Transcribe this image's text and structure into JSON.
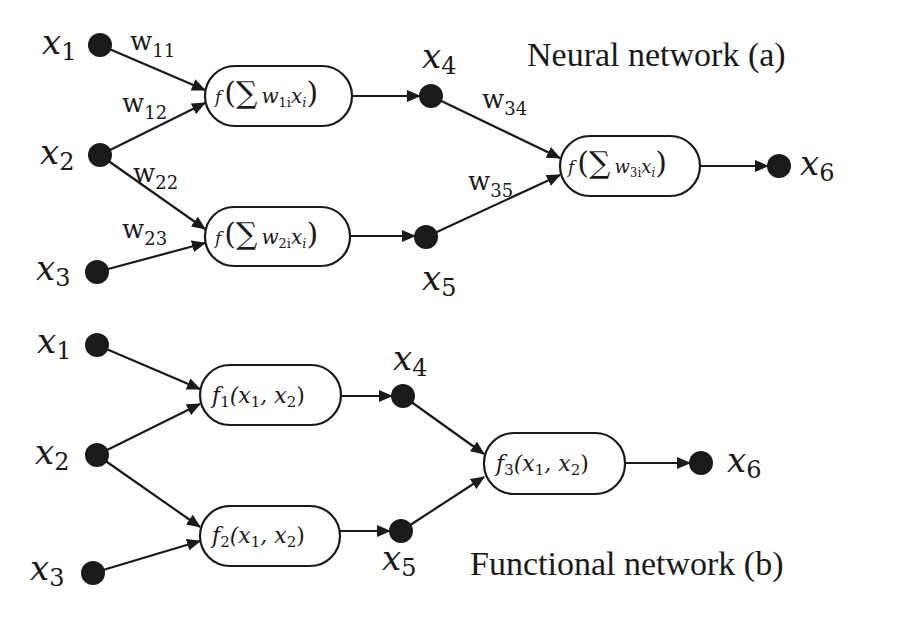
{
  "diagram": {
    "panels": [
      {
        "id": "a",
        "title": "Neural network (a)",
        "inputs": [
          {
            "var": "x",
            "sub": "1"
          },
          {
            "var": "x",
            "sub": "2"
          },
          {
            "var": "x",
            "sub": "3"
          }
        ],
        "hidden": [
          {
            "var": "x",
            "sub": "4"
          },
          {
            "var": "x",
            "sub": "5"
          }
        ],
        "output": {
          "var": "x",
          "sub": "6"
        },
        "units": [
          {
            "f": "f",
            "sigma": "∑",
            "w": "w",
            "wsub": "1i",
            "x": "x",
            "xsub": "i"
          },
          {
            "f": "f",
            "sigma": "∑",
            "w": "w",
            "wsub": "2i",
            "x": "x",
            "xsub": "i"
          },
          {
            "f": "f",
            "sigma": "∑",
            "w": "w",
            "wsub": "3i",
            "x": "x",
            "xsub": "i"
          }
        ],
        "weights": [
          {
            "w": "w",
            "sub": "11"
          },
          {
            "w": "w",
            "sub": "12"
          },
          {
            "w": "w",
            "sub": "22"
          },
          {
            "w": "w",
            "sub": "23"
          },
          {
            "w": "w",
            "sub": "34"
          },
          {
            "w": "w",
            "sub": "35"
          }
        ]
      },
      {
        "id": "b",
        "title": "Functional network (b)",
        "inputs": [
          {
            "var": "x",
            "sub": "1"
          },
          {
            "var": "x",
            "sub": "2"
          },
          {
            "var": "x",
            "sub": "3"
          }
        ],
        "hidden": [
          {
            "var": "x",
            "sub": "4"
          },
          {
            "var": "x",
            "sub": "5"
          }
        ],
        "output": {
          "var": "x",
          "sub": "6"
        },
        "units": [
          {
            "f": "f",
            "fsub": "1",
            "args": "(x",
            "a1": "1",
            "comma": ", x",
            "a2": "2",
            "close": ")"
          },
          {
            "f": "f",
            "fsub": "2",
            "args": "(x",
            "a1": "1",
            "comma": ", x",
            "a2": "2",
            "close": ")"
          },
          {
            "f": "f",
            "fsub": "3",
            "args": "(x",
            "a1": "1",
            "comma": ", x",
            "a2": "2",
            "close": ")"
          }
        ]
      }
    ]
  }
}
